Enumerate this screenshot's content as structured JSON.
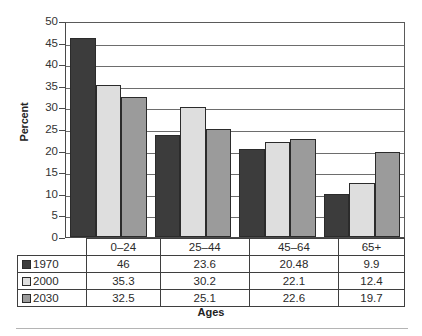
{
  "chart_data": {
    "type": "bar",
    "title": "",
    "xlabel": "Ages",
    "ylabel": "Percent",
    "categories": [
      "0–24",
      "25–44",
      "45–64",
      "65+"
    ],
    "series": [
      {
        "name": "1970",
        "values": [
          46,
          23.6,
          20.48,
          9.9
        ],
        "color": "#3c3c3c"
      },
      {
        "name": "2000",
        "values": [
          35.3,
          30.2,
          22.1,
          12.4
        ],
        "color": "#dedede"
      },
      {
        "name": "2030",
        "values": [
          32.5,
          25.1,
          22.6,
          19.7
        ],
        "color": "#9b9b9b"
      }
    ],
    "ylim": [
      0,
      50
    ],
    "ytick_step": 5,
    "yticks": [
      50,
      45,
      40,
      35,
      30,
      25,
      20,
      15,
      10,
      5,
      0
    ],
    "ytick_labels": [
      "50",
      "45",
      "40",
      "35",
      "30",
      "25",
      "20",
      "15",
      "10",
      "5",
      "0"
    ],
    "grid": true,
    "legend_position": "table-row-headers",
    "value_labels": {
      "1970": [
        "46",
        "23.6",
        "20.48",
        "9.9"
      ],
      "2000": [
        "35.3",
        "30.2",
        "22.1",
        "12.4"
      ],
      "2030": [
        "32.5",
        "25.1",
        "22.6",
        "19.7"
      ]
    }
  },
  "table": {
    "header_row": [
      "",
      "0–24",
      "25–44",
      "45–64",
      "65+"
    ],
    "rows": [
      {
        "label": "1970",
        "cells": [
          "46",
          "23.6",
          "20.48",
          "9.9"
        ]
      },
      {
        "label": "2000",
        "cells": [
          "35.3",
          "30.2",
          "22.1",
          "12.4"
        ]
      },
      {
        "label": "2030",
        "cells": [
          "32.5",
          "25.1",
          "22.6",
          "19.7"
        ]
      }
    ]
  },
  "colors": {
    "series_1970": "#3c3c3c",
    "series_2000": "#dedede",
    "series_2030": "#9b9b9b",
    "gridline": "#6d6d6d",
    "axis": "#4a4a4a",
    "table_border": "#3f3f3f",
    "bottom_rule": "#b4b4b4"
  }
}
